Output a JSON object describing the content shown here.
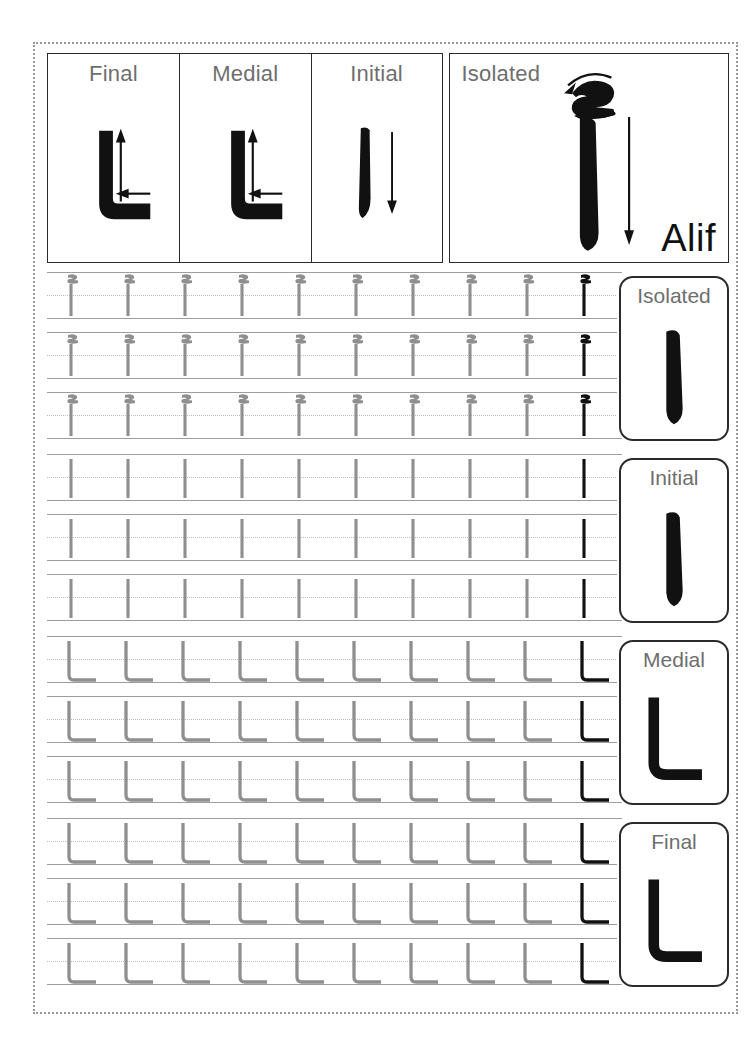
{
  "worksheet": {
    "letter_name": "Alif",
    "letter_isolated": "ا",
    "letter_with_hamza": "أ"
  },
  "header": {
    "cells": [
      {
        "label": "Final",
        "form": "final",
        "art": "lam-alif-L-with-arrows"
      },
      {
        "label": "Medial",
        "form": "medial",
        "art": "lam-alif-L-with-arrows"
      },
      {
        "label": "Initial",
        "form": "initial",
        "art": "alif-bar-with-down-arrow"
      },
      {
        "label": "Isolated",
        "form": "isolated",
        "art": "alif-hamza-with-arrows"
      }
    ],
    "isolated_name_label": "Alif"
  },
  "sections": [
    {
      "id": "isolated",
      "card_title": "Isolated",
      "card_glyph": "alif",
      "trace_glyph": "alif-hamza",
      "rows": 3,
      "glyphs_per_row": 10,
      "trace_count": 9,
      "model_count": 1
    },
    {
      "id": "initial",
      "card_title": "Initial",
      "card_glyph": "alif",
      "trace_glyph": "alif-bar",
      "rows": 3,
      "glyphs_per_row": 10,
      "trace_count": 9,
      "model_count": 1
    },
    {
      "id": "medial",
      "card_title": "Medial",
      "card_glyph": "lam-shape",
      "trace_glyph": "lam-shape",
      "rows": 3,
      "glyphs_per_row": 10,
      "trace_count": 9,
      "model_count": 1
    },
    {
      "id": "final",
      "card_title": "Final",
      "card_glyph": "lam-shape",
      "trace_glyph": "lam-shape",
      "rows": 3,
      "glyphs_per_row": 10,
      "trace_count": 9,
      "model_count": 1
    }
  ],
  "colors": {
    "trace_gray": "#8f8f8f",
    "model_black": "#111111",
    "rule_line": "#9d9d9d",
    "dotted_line": "#bdbdbd",
    "label_gray": "#6e6e6e",
    "border_dark": "#2b2b2b",
    "sheet_border": "#9a9a9a",
    "page_background": "#ffffff"
  }
}
